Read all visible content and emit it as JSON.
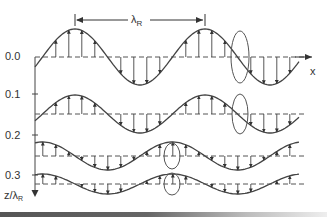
{
  "figure": {
    "wavelength_label": "λ",
    "wavelength_subscript": "R",
    "x_axis_label": "x",
    "z_axis_label": "z/λ",
    "z_axis_subscript": "R",
    "depth_ticks": [
      {
        "label": "0.0",
        "value": 0.0
      },
      {
        "label": "0.1",
        "value": 0.1
      },
      {
        "label": "0.2",
        "value": 0.2
      },
      {
        "label": "0.3",
        "value": 0.3
      }
    ],
    "colors": {
      "line": "#444444",
      "dashed": "#555555",
      "text": "#333333",
      "background": "#ffffff"
    }
  },
  "chart_data": {
    "type": "diagram",
    "rows": [
      {
        "depth": 0.0,
        "baseline_y": 57,
        "amplitude": 28,
        "phase_shift": 0,
        "ellipse_x": 240,
        "ellipse_rx": 9,
        "ellipse_ry": 26
      },
      {
        "depth": 0.1,
        "baseline_y": 114,
        "amplitude": 19,
        "phase_shift": 0,
        "ellipse_x": 240,
        "ellipse_rx": 8,
        "ellipse_ry": 20
      },
      {
        "depth": 0.2,
        "baseline_y": 156,
        "amplitude": 14,
        "phase_shift": -0.25,
        "ellipse_x": 172,
        "ellipse_rx": 8,
        "ellipse_ry": 13
      },
      {
        "depth": 0.3,
        "baseline_y": 184,
        "amplitude": 10,
        "phase_shift": -0.25,
        "ellipse_x": 172,
        "ellipse_rx": 8,
        "ellipse_ry": 11
      }
    ],
    "wavelength_px": 130,
    "wavelength_marker": {
      "x_start": 75,
      "x_end": 205,
      "y": 20
    }
  }
}
